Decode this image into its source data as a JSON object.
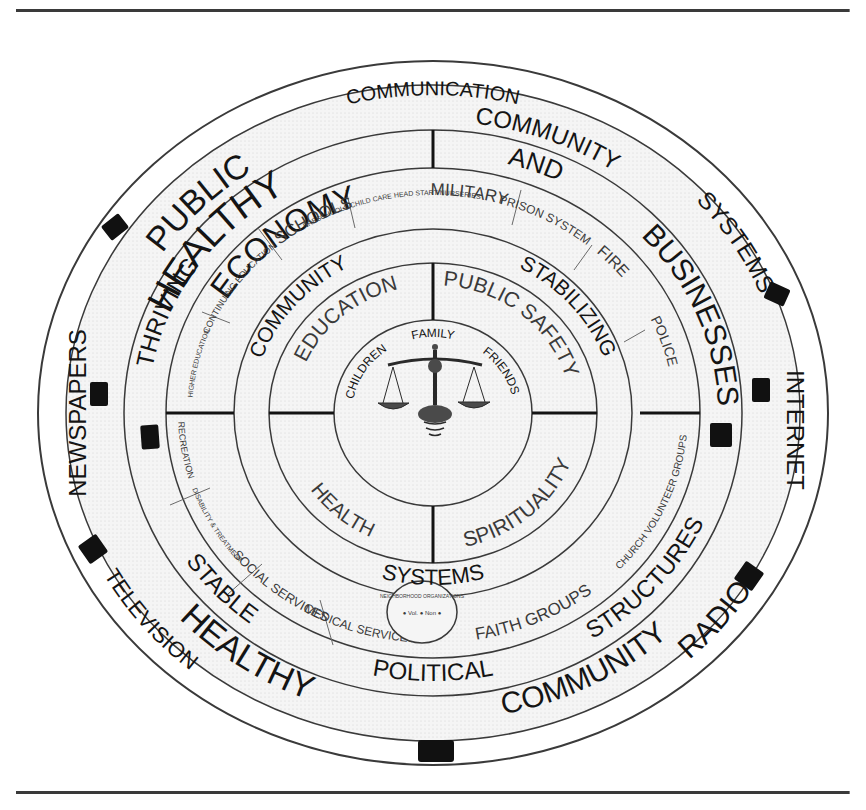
{
  "figure": {
    "center_icon": "scales-of-justice-icon",
    "colors": {
      "ink": "#141414",
      "line": "#3a3a3a",
      "fill": "#f3f3f3",
      "background": "#ffffff"
    }
  },
  "outer_ring": {
    "name": "Media / Communication",
    "labels": {
      "top": "COMMUNICATION",
      "left": "NEWSPAPERS",
      "right": "INTERNET",
      "bottom_left": "TELEVISION",
      "bottom_right": "RADIO"
    },
    "marker_count": 8
  },
  "title_ring": {
    "labels": {
      "public": "PUBLIC",
      "healthy_top": "HEALTHY",
      "community_top": "COMMUNITY",
      "systems": "SYSTEMS",
      "healthy_bottom": "HEALTHY",
      "community_bottom": "COMMUNITY"
    }
  },
  "ring3": {
    "labels": {
      "economy": "ECONOMY",
      "and": "AND",
      "businesses": "BUSINESSES",
      "structures": "STRUCTURES",
      "political": "POLITICAL",
      "stable": "STABLE",
      "thriving": "THRIVING"
    }
  },
  "ring4_services": {
    "items": [
      "SCHOOLS",
      "PRESCHOOLS CHILD CARE HEAD START NURSERIES",
      "MILITARY",
      "PRISON SYSTEM",
      "FIRE",
      "POLICE",
      "CHURCH VOLUNTEER GROUPS",
      "FAITH GROUPS",
      "NEIGHBORHOOD ORGANIZATIONS",
      "MEDICAL SERVICES",
      "SOCIAL SERVICES",
      "DISABILITY & TREATMENT",
      "RECREATION",
      "HIGHER EDUCATION",
      "CONTINUING EDUCATION"
    ],
    "neighborhood_badge_inner": "● Vol. ● Non ●"
  },
  "ring5": {
    "labels": {
      "community": "COMMUNITY",
      "stabilizing": "STABILIZING",
      "systems": "SYSTEMS"
    }
  },
  "ring6_quadrants": {
    "top_left": "EDUCATION",
    "top_right": "PUBLIC SAFETY",
    "bottom_left": "HEALTH",
    "bottom_right": "SPIRITUALITY"
  },
  "core": {
    "labels": {
      "top": "FAMILY",
      "left": "CHILDREN",
      "right": "FRIENDS"
    }
  }
}
